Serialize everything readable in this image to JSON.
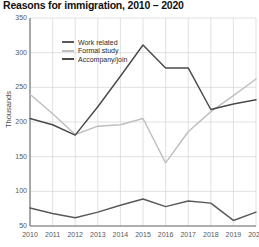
{
  "title": "Reasons for immigration, 2010 – 2020",
  "axis": {
    "ylabel": "Thousands",
    "yticks": [
      "350",
      "300",
      "250",
      "200",
      "150",
      "100",
      "50"
    ],
    "xticks": [
      "2010",
      "2011",
      "2012",
      "2013",
      "2014",
      "2015",
      "2016",
      "2017",
      "2018",
      "2019",
      "2020"
    ]
  },
  "legend": {
    "items": [
      {
        "label": "Work related",
        "color": "#595959"
      },
      {
        "label": "Formal study",
        "color": "#bfbfbf"
      },
      {
        "label": "Accompany/join",
        "color": "#4a4a4a"
      }
    ]
  },
  "chart_data": {
    "type": "line",
    "title": "Reasons for immigration, 2010 – 2020",
    "xlabel": "",
    "ylabel": "Thousands",
    "x": [
      2010,
      2011,
      2012,
      2013,
      2014,
      2015,
      2016,
      2017,
      2018,
      2019,
      2020
    ],
    "categories": [
      "2010",
      "2011",
      "2012",
      "2013",
      "2014",
      "2015",
      "2016",
      "2017",
      "2018",
      "2019",
      "2020"
    ],
    "ylim": [
      50,
      350
    ],
    "ytick_step": 50,
    "grid": true,
    "legend_position": "inside-top-left",
    "series": [
      {
        "name": "Work related",
        "color": "#595959",
        "values": [
          76,
          68,
          62,
          70,
          80,
          89,
          78,
          86,
          83,
          58,
          70
        ]
      },
      {
        "name": "Formal study",
        "color": "#bfbfbf",
        "values": [
          240,
          212,
          182,
          194,
          196,
          205,
          141,
          186,
          215,
          238,
          262
        ]
      },
      {
        "name": "Accompany/join",
        "color": "#4a4a4a",
        "values": [
          205,
          196,
          181,
          222,
          266,
          311,
          278,
          278,
          218,
          226,
          232
        ]
      }
    ]
  }
}
